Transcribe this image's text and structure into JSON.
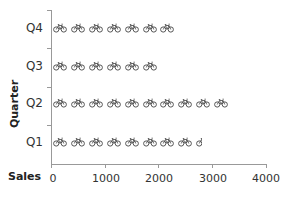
{
  "chart_data": {
    "type": "bar",
    "orientation": "horizontal",
    "style": "pictograph",
    "icon": "bicycle-icon",
    "icon_unit": 333.33,
    "title": "",
    "xlabel": "Sales",
    "ylabel": "Quarter",
    "categories": [
      "Q1",
      "Q2",
      "Q3",
      "Q4"
    ],
    "values": [
      2780,
      3300,
      2000,
      2330
    ],
    "xlim": [
      0,
      4000
    ],
    "xticks": [
      "0",
      "1000",
      "2000",
      "3000",
      "4000"
    ],
    "grid": false,
    "legend": null,
    "color": "#555555"
  },
  "axes": {
    "x_title": "Sales",
    "y_title": "Quarter",
    "x_ticks": [
      "0",
      "1000",
      "2000",
      "3000",
      "4000"
    ],
    "y_ticks": [
      "Q1",
      "Q2",
      "Q3",
      "Q4"
    ]
  }
}
